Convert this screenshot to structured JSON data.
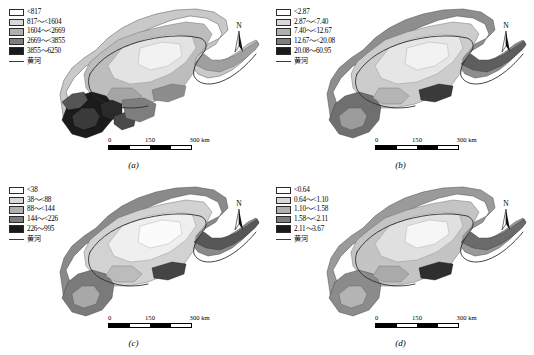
{
  "figure": {
    "panels": [
      {
        "id": "a",
        "caption": "(a)",
        "legend": {
          "items": [
            {
              "label": "<817",
              "color": "#ffffff"
            },
            {
              "label": "817～<1604",
              "color": "#d9d9d9"
            },
            {
              "label": "1604～<2669",
              "color": "#b0b0b0"
            },
            {
              "label": "2669～<3855",
              "color": "#7d7d7d"
            },
            {
              "label": "3855～6250",
              "color": "#1a1a1a"
            }
          ],
          "river_label": "黄河"
        },
        "scale": {
          "ticks": [
            "0",
            "150",
            "300 km"
          ]
        },
        "north_label": "N"
      },
      {
        "id": "b",
        "caption": "(b)",
        "legend": {
          "items": [
            {
              "label": "<2.87",
              "color": "#ffffff"
            },
            {
              "label": "2.87～<7.40",
              "color": "#d9d9d9"
            },
            {
              "label": "7.40～<12.67",
              "color": "#b0b0b0"
            },
            {
              "label": "12.67～<20.08",
              "color": "#7d7d7d"
            },
            {
              "label": "20.08～60.95",
              "color": "#1a1a1a"
            }
          ],
          "river_label": "黄河"
        },
        "scale": {
          "ticks": [
            "0",
            "150",
            "300 km"
          ]
        },
        "north_label": "N"
      },
      {
        "id": "c",
        "caption": "(c)",
        "legend": {
          "items": [
            {
              "label": "<38",
              "color": "#ffffff"
            },
            {
              "label": "38～<88",
              "color": "#d9d9d9"
            },
            {
              "label": "88～<144",
              "color": "#b0b0b0"
            },
            {
              "label": "144～<226",
              "color": "#7d7d7d"
            },
            {
              "label": "226～995",
              "color": "#1a1a1a"
            }
          ],
          "river_label": "黄河"
        },
        "scale": {
          "ticks": [
            "0",
            "150",
            "300 km"
          ]
        },
        "north_label": "N"
      },
      {
        "id": "d",
        "caption": "(d)",
        "legend": {
          "items": [
            {
              "label": "<0.64",
              "color": "#ffffff"
            },
            {
              "label": "0.64～<1.10",
              "color": "#d9d9d9"
            },
            {
              "label": "1.10～<1.58",
              "color": "#b0b0b0"
            },
            {
              "label": "1.58～<2.11",
              "color": "#7d7d7d"
            },
            {
              "label": "2.11～3.67",
              "color": "#1a1a1a"
            }
          ],
          "river_label": "黄河"
        },
        "scale": {
          "ticks": [
            "0",
            "150",
            "300 km"
          ]
        },
        "north_label": "N"
      }
    ]
  }
}
